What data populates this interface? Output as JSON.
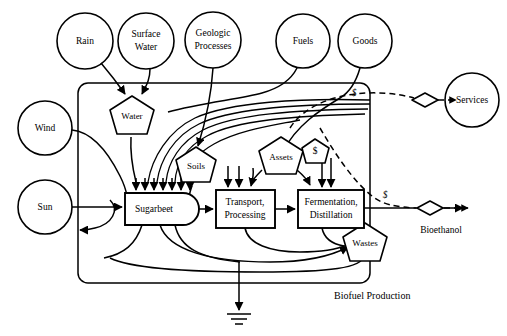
{
  "diagram": {
    "title": "Biofuel Production",
    "caption_label": "Biofuel Production",
    "sources": [
      {
        "id": "rain",
        "label": "Rain",
        "lines": [
          "Rain"
        ],
        "cx": 85,
        "cy": 41,
        "r": 28
      },
      {
        "id": "surface",
        "label": "Surface Water",
        "lines": [
          "Surface",
          "Water"
        ],
        "cx": 146,
        "cy": 41,
        "r": 28
      },
      {
        "id": "geologic",
        "label": "Geologic Processes",
        "lines": [
          "Geologic",
          "Processes"
        ],
        "cx": 213,
        "cy": 40,
        "r": 28
      },
      {
        "id": "fuels",
        "label": "Fuels",
        "lines": [
          "Fuels"
        ],
        "cx": 303,
        "cy": 41,
        "r": 27
      },
      {
        "id": "goods",
        "label": "Goods",
        "lines": [
          "Goods"
        ],
        "cx": 365,
        "cy": 41,
        "r": 27
      },
      {
        "id": "wind",
        "label": "Wind",
        "lines": [
          "Wind"
        ],
        "cx": 45,
        "cy": 128,
        "r": 27
      },
      {
        "id": "sun",
        "label": "Sun",
        "lines": [
          "Sun"
        ],
        "cx": 45,
        "cy": 207,
        "r": 27
      },
      {
        "id": "services",
        "label": "Services",
        "lines": [
          "Services"
        ],
        "cx": 472,
        "cy": 100,
        "r": 27
      }
    ],
    "storages": [
      {
        "id": "water",
        "label": "Water",
        "cx": 132,
        "cy": 117,
        "w": 44,
        "h": 40
      },
      {
        "id": "soils",
        "label": "Soils",
        "cx": 196,
        "cy": 166,
        "w": 42,
        "h": 38
      },
      {
        "id": "assets",
        "label": "Assets",
        "cx": 281,
        "cy": 157,
        "w": 46,
        "h": 40
      },
      {
        "id": "money",
        "label": "$",
        "cx": 315,
        "cy": 152,
        "w": 28,
        "h": 26
      },
      {
        "id": "wastes",
        "label": "Wastes",
        "cx": 365,
        "cy": 243,
        "w": 44,
        "h": 40
      }
    ],
    "producer": {
      "id": "sugarbeet",
      "label": "Sugarbeet",
      "x": 125,
      "y": 193,
      "w": 74,
      "h": 32
    },
    "processes": [
      {
        "id": "transport",
        "label": "Transport, Processing",
        "lines": [
          "Transport,",
          "Processing"
        ],
        "x": 216,
        "y": 190,
        "w": 59,
        "h": 38
      },
      {
        "id": "fermentation",
        "label": "Fermentation, Distillation",
        "lines": [
          "Fermentation,",
          "Distillation"
        ],
        "x": 298,
        "y": 190,
        "w": 66,
        "h": 38
      }
    ],
    "transactions": [
      {
        "id": "services-transaction",
        "label": "",
        "cx": 425,
        "cy": 100,
        "w": 26,
        "h": 13
      },
      {
        "id": "bioethanol-transaction",
        "label": "Bioethanol",
        "cx": 430,
        "cy": 208,
        "w": 26,
        "h": 13
      }
    ],
    "outputs": [
      {
        "id": "bioethanol-output",
        "label": "Bioethanol",
        "x": 434,
        "y": 228
      }
    ],
    "money_flow_labels": [
      {
        "id": "money-label-services",
        "label": "$",
        "x": 354,
        "y": 94
      },
      {
        "id": "money-label-bioethanol",
        "label": "$",
        "x": 385,
        "y": 196
      }
    ],
    "ground": {
      "id": "heat-sink-ground",
      "x": 239,
      "y": 318
    },
    "boundary": {
      "x": 78,
      "y": 83,
      "w": 292,
      "h": 200,
      "rx": 10
    }
  }
}
